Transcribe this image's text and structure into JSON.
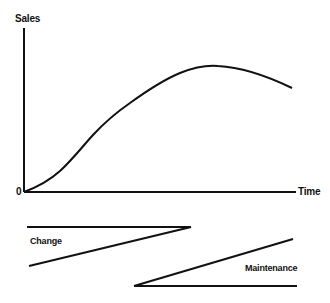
{
  "diagram": {
    "y_axis_label": "Sales",
    "x_axis_label": "Time",
    "origin_label": "0",
    "curve": "product life cycle sales curve rising from origin, peaking, then declining",
    "wedges": [
      {
        "label": "Change",
        "direction": "decreasing over time"
      },
      {
        "label": "Maintenance",
        "direction": "increasing over time"
      }
    ],
    "colors": {
      "line": "#111111",
      "background": "#ffffff"
    }
  }
}
